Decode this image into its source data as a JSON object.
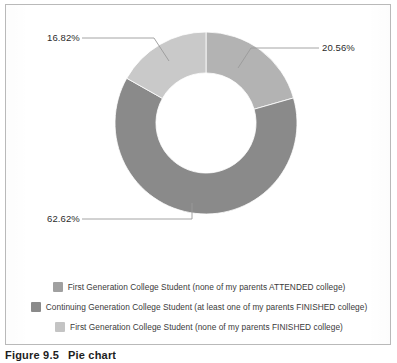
{
  "figure": {
    "caption_number": "Figure 9.5",
    "caption_text": "Pie chart"
  },
  "chart_data": {
    "type": "pie",
    "variant": "donut",
    "title": "",
    "subtitle": "",
    "xlabel": "",
    "ylabel": "",
    "grid": false,
    "legend_position": "bottom",
    "start_angle_deg": 0,
    "direction": "clockwise",
    "inner_radius_ratio": 0.55,
    "categories": [
      "First Generation College Student (none of my parents FINISHED college)",
      "Continuing Generation College Student (at least one of my parents FINISHED college)",
      "First Generation College Student (none of my parents ATTENDED college)"
    ],
    "values": [
      20.56,
      62.62,
      16.82
    ],
    "value_labels": [
      "20.56%",
      "62.62%",
      "16.82%"
    ],
    "colors": [
      "#b3b3b3",
      "#8a8a8a",
      "#c9c9c9"
    ],
    "units": "percent",
    "total": 100.0
  },
  "callouts": [
    {
      "id": "topleft",
      "text": "16.82%"
    },
    {
      "id": "right",
      "text": "20.56%"
    },
    {
      "id": "bottom",
      "text": "62.62%"
    }
  ],
  "legend": {
    "items": [
      {
        "label": "First Generation College Student (none of my parents ATTENDED college)",
        "color": "#a0a0a0"
      },
      {
        "label": "Continuing Generation College Student (at least one of my parents FINISHED college)",
        "color": "#8a8a8a"
      },
      {
        "label": "First Generation College Student (none of my parents FINISHED college)",
        "color": "#c4c4c4"
      }
    ]
  },
  "colors": {
    "frame_border": "#b9b9b9",
    "background": "#ffffff",
    "leader_line": "#9a9a9a",
    "label_text": "#2b2b2b",
    "legend_text": "#3a3a3a",
    "caption_text": "#1d1d1d"
  }
}
